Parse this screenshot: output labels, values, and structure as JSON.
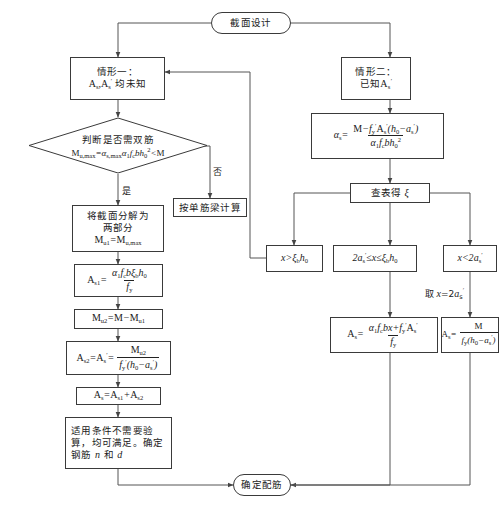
{
  "diagram": {
    "title_terminal": "截面设计",
    "end_terminal": "确定配筋",
    "nodes": {
      "case1_line1": "情形一：",
      "case1_line2_math": "A_s, A'_s 均未知",
      "case1_tail": "均未知",
      "case2_line1": "情形二：",
      "case2_tail": "已知",
      "decision_line1": "判断是否需双筋",
      "decision_line2_math": "M_u,max = α_s,max α_1 f_c b h_0² < M",
      "single_beam": "按单筋梁计算",
      "split_line1": "将截面分解为",
      "split_line2": "两部分",
      "split_line3_math": "M_u1 = M_u,max",
      "as1_math": "A_s1 = α_1 f_c b ξ_b h_0 / f_y",
      "mu2_math": "M_u2 = M − M_u1",
      "as2_math": "A_s2 = A'_s = M_u2 / [ f'_y ( h_0 − a'_s ) ]",
      "as_sum_math": "A_s = A_s1 + A_s2",
      "final_left_l1": "适用条件不需要验",
      "final_left_l2": "算，均可满足。确定",
      "final_left_l3": "钢筋 n 和 d",
      "alpha_s_math": "α_s = [ M − f'_y A'_s ( h_0 − a'_s ) ] / ( α_1 f_c b h_0² )",
      "lookup_xi": "查表得 ξ",
      "cond_a": "x > ξ_b h_0",
      "cond_b": "2a'_s ≤ x ≤ ξ_b h_0",
      "cond_c": "x < 2a'_s",
      "take_x": "取 x = 2a'_s",
      "as_mid_math": "A_s = ( α_1 f_c b x + f'_y A'_s ) / f_y",
      "as_right_math": "A_s = M / [ f_y ( h_0 − a'_s ) ]"
    },
    "edge_labels": {
      "yes": "是",
      "no": "否"
    },
    "symbols": {
      "M": "M",
      "A": "A",
      "s": "s",
      "x": "x",
      "d": "d",
      "n": "n",
      "alpha": "α",
      "xi": "ξ",
      "f": "f",
      "b": "b",
      "h": "h",
      "a": "a",
      "prime": "′",
      "le": "≤",
      "lt": "<",
      "gt": ">",
      "minus": "−",
      "eq": "="
    },
    "colors": {
      "stroke": "#3a3a3a",
      "line": "#555555",
      "background": "#ffffff",
      "text": "#1a1a1a"
    }
  }
}
